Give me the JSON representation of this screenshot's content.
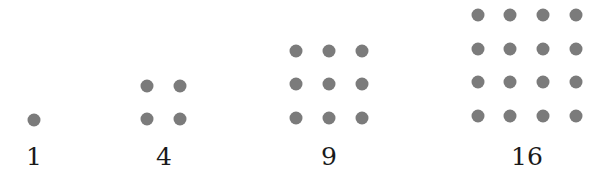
{
  "figure": {
    "dot_color": "#7b7b7b",
    "groups": [
      {
        "label": "1",
        "n": 1,
        "cx": 34,
        "x": [
          34
        ],
        "y": [
          120
        ]
      },
      {
        "label": "4",
        "n": 2,
        "cx": 164,
        "x": [
          147,
          180
        ],
        "y": [
          86,
          119
        ]
      },
      {
        "label": "9",
        "n": 3,
        "cx": 329,
        "x": [
          296,
          329,
          362
        ],
        "y": [
          51,
          84,
          118
        ]
      },
      {
        "label": "16",
        "n": 4,
        "cx": 527,
        "x": [
          478,
          510,
          543,
          576
        ],
        "y": [
          15,
          49,
          82,
          116
        ]
      }
    ]
  }
}
